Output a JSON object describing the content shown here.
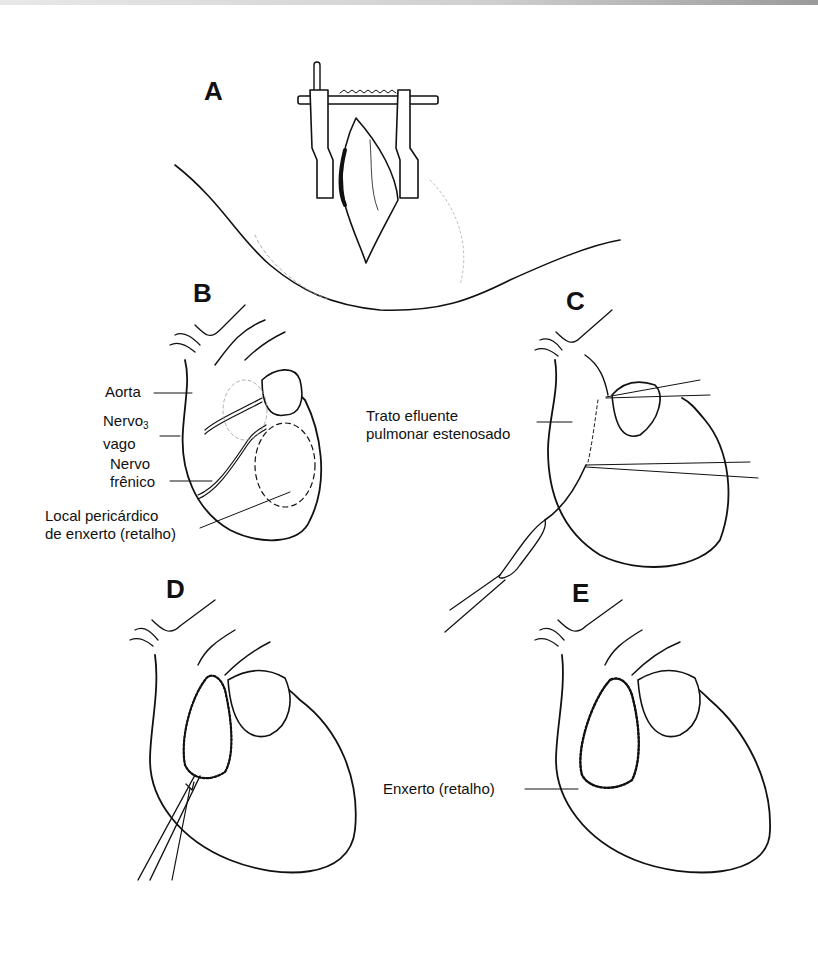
{
  "figure": {
    "panels": [
      {
        "id": "A",
        "letter": "A"
      },
      {
        "id": "B",
        "letter": "B"
      },
      {
        "id": "C",
        "letter": "C"
      },
      {
        "id": "D",
        "letter": "D"
      },
      {
        "id": "E",
        "letter": "E"
      }
    ],
    "labels": {
      "aorta": "Aorta",
      "nervo_vago_line1": "Nervo",
      "nervo_vago_sub": "3",
      "nervo_vago_line2": "vago",
      "nervo_frenico_line1": "Nervo",
      "nervo_frenico_line2": "frênico",
      "local_line1": "Local pericárdico",
      "local_line2": "de enxerto (retalho)",
      "trato_line1": "Trato efluente",
      "trato_line2": "pulmonar estenosado",
      "enxerto": "Enxerto (retalho)"
    },
    "colors": {
      "ink": "#111111",
      "background": "#ffffff"
    }
  }
}
